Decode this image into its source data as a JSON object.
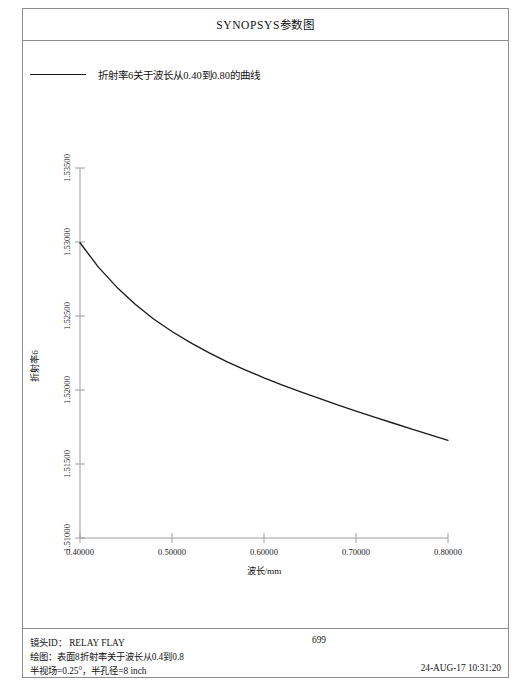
{
  "document": {
    "title": "SYNOPSYS参数图"
  },
  "legend": {
    "entries": [
      {
        "label": "折射率6关于波长从0.40到0.80的曲线",
        "color": "#1b1b1b"
      }
    ]
  },
  "footer": {
    "lens_id": "镜头ID： RELAY FLAY",
    "plot_desc": "绘图：表面8折射率关于波长从0.4到0.8",
    "field_desc": "半视场=0.25°，半孔径=8 inch",
    "page_number": "699",
    "datetime": "24-AUG-17 10:31:20"
  },
  "chart_data": {
    "type": "line",
    "title": "",
    "xlabel": "波长/mm",
    "ylabel": "折射率6",
    "xlim": [
      0.4,
      0.8
    ],
    "ylim": [
      1.51,
      1.535
    ],
    "grid": false,
    "legend_position": "above-plot-left",
    "xticks": [
      0.4,
      0.5,
      0.6,
      0.7,
      0.8
    ],
    "xtick_labels": [
      "0.40000",
      "0.50000",
      "0.60000",
      "0.70000",
      "0.80000"
    ],
    "yticks": [
      1.51,
      1.515,
      1.52,
      1.525,
      1.53,
      1.535
    ],
    "ytick_labels": [
      "1.51000",
      "1.51500",
      "1.52000",
      "1.52500",
      "1.53000",
      "1.53500"
    ],
    "series": [
      {
        "name": "折射率6关于波长从0.40到0.80的曲线",
        "color": "#1b1b1b",
        "x": [
          0.4,
          0.42,
          0.44,
          0.46,
          0.48,
          0.5,
          0.52,
          0.54,
          0.56,
          0.58,
          0.6,
          0.62,
          0.64,
          0.66,
          0.68,
          0.7,
          0.72,
          0.74,
          0.76,
          0.78,
          0.8
        ],
        "y": [
          1.52995,
          1.5283,
          1.52695,
          1.5258,
          1.5248,
          1.52395,
          1.5232,
          1.52252,
          1.5219,
          1.52135,
          1.52082,
          1.52033,
          1.51987,
          1.51943,
          1.519,
          1.51858,
          1.51817,
          1.51777,
          1.51737,
          1.51698,
          1.5166
        ]
      }
    ]
  }
}
